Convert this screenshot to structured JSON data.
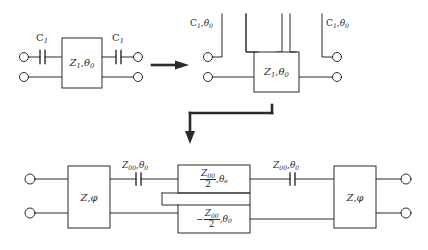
{
  "figure": {
    "type": "circuit-equivalence-diagram",
    "stroke_color": "#2b2b2b",
    "background_color": "#ffffff"
  },
  "stage1": {
    "name": "capacitively-coupled-line-section",
    "cap_left": {
      "label_Z": "C",
      "label_sub": "1"
    },
    "cap_right": {
      "label_Z": "C",
      "label_sub": "1"
    },
    "box": {
      "label_Z": "Z",
      "label_Z_sub": "1",
      "sep": ",",
      "label_theta": "θ",
      "label_theta_sub": "0"
    }
  },
  "arrow_right": {
    "name": "transform-arrow-right",
    "glyph": "→"
  },
  "stage2": {
    "name": "open-stub-equivalent",
    "stub_left": {
      "label_C": "C",
      "label_C_sub": "1",
      "sep": ",",
      "label_theta": "θ",
      "label_theta_sub": "0"
    },
    "stub_right": {
      "label_C": "C",
      "label_C_sub": "1",
      "sep": ",",
      "label_theta": "θ",
      "label_theta_sub": "0"
    },
    "box": {
      "label_Z": "Z",
      "label_Z_sub": "1",
      "sep": ",",
      "label_theta": "θ",
      "label_theta_sub": "0"
    }
  },
  "arrow_down": {
    "name": "transform-arrow-down-elbow",
    "glyph": "↓"
  },
  "stage3": {
    "name": "final-equivalent-network",
    "box_left": {
      "label_Z": "Z",
      "sep": ",",
      "label_phi": "φ"
    },
    "box_right": {
      "label_Z": "Z",
      "sep": ",",
      "label_phi": "φ"
    },
    "series_left": {
      "label_Z": "Z",
      "label_Z_sub": "00",
      "sep": ",",
      "label_theta": "θ",
      "label_theta_sub": "0"
    },
    "series_right": {
      "label_Z": "Z",
      "label_Z_sub": "00",
      "sep": ",",
      "label_theta": "θ",
      "label_theta_sub": "0"
    },
    "box_top": {
      "minus": "",
      "num_Z": "Z",
      "num_Z_sub": "00",
      "den": "2",
      "sep": ",",
      "label_theta": "θ",
      "label_theta_sub": "e"
    },
    "box_bottom": {
      "minus": "−",
      "num_Z": "Z",
      "num_Z_sub": "00",
      "den": "2",
      "sep": ",",
      "label_theta": "θ",
      "label_theta_sub": "0"
    }
  }
}
